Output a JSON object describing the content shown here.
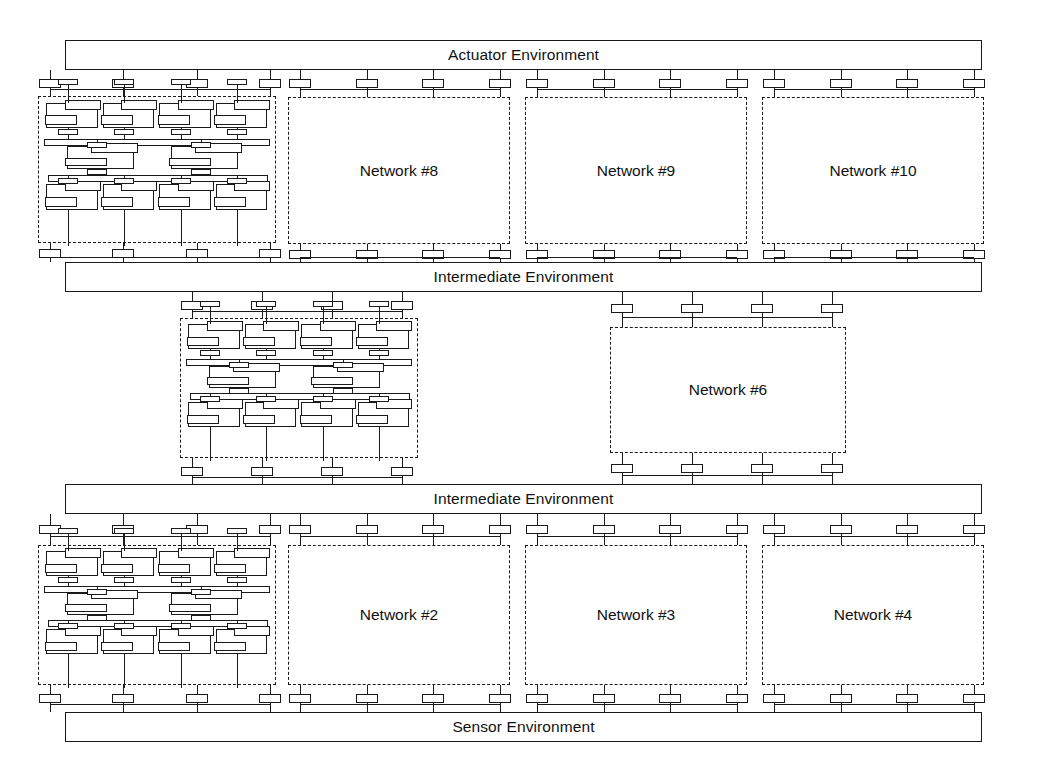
{
  "diagram": {
    "stroke_color": "#1a1a1a",
    "background_color": "#ffffff",
    "width": 1038,
    "height": 778
  },
  "environments": [
    {
      "id": "actuator",
      "label": "Actuator Environment",
      "x": 65,
      "y": 40,
      "w": 917,
      "h": 30
    },
    {
      "id": "intermediate1",
      "label": "Intermediate Environment",
      "x": 65,
      "y": 262,
      "w": 917,
      "h": 30
    },
    {
      "id": "intermediate2",
      "label": "Intermediate Environment",
      "x": 65,
      "y": 484,
      "w": 917,
      "h": 30
    },
    {
      "id": "sensor",
      "label": "Sensor Environment",
      "x": 65,
      "y": 712,
      "w": 917,
      "h": 30
    }
  ],
  "networks": [
    {
      "id": "net8",
      "label": "Network #8",
      "x": 288,
      "y": 97,
      "w": 222,
      "h": 147
    },
    {
      "id": "net9",
      "label": "Network #9",
      "x": 525,
      "y": 97,
      "w": 222,
      "h": 147
    },
    {
      "id": "net10",
      "label": "Network #10",
      "x": 762,
      "y": 97,
      "w": 222,
      "h": 147
    },
    {
      "id": "net6",
      "label": "Network #6",
      "x": 610,
      "y": 327,
      "w": 236,
      "h": 126
    },
    {
      "id": "net2",
      "label": "Network #2",
      "x": 288,
      "y": 545,
      "w": 222,
      "h": 140
    },
    {
      "id": "net3",
      "label": "Network #3",
      "x": 525,
      "y": 545,
      "w": 222,
      "h": 140
    },
    {
      "id": "net4",
      "label": "Network #4",
      "x": 762,
      "y": 545,
      "w": 222,
      "h": 140
    }
  ],
  "expanded_networks": [
    {
      "id": "expanded-top",
      "x": 38,
      "y": 96,
      "w": 238,
      "h": 147,
      "note": "expanded recursive network detail"
    },
    {
      "id": "expanded-middle",
      "x": 180,
      "y": 318,
      "w": 238,
      "h": 140,
      "note": "expanded recursive network detail"
    },
    {
      "id": "expanded-bottom",
      "x": 38,
      "y": 545,
      "w": 238,
      "h": 140,
      "note": "expanded recursive network detail"
    }
  ],
  "connector_groups": [
    {
      "id": "actuator-to-expanded-top",
      "x": 50,
      "w": 220,
      "top_y": 70,
      "bottom_y": 96,
      "count": 4,
      "direction": "down"
    },
    {
      "id": "actuator-to-net8",
      "x": 300,
      "w": 200,
      "top_y": 70,
      "bottom_y": 97,
      "count": 4,
      "direction": "down"
    },
    {
      "id": "actuator-to-net9",
      "x": 537,
      "w": 200,
      "top_y": 70,
      "bottom_y": 97,
      "count": 4,
      "direction": "down"
    },
    {
      "id": "actuator-to-net10",
      "x": 774,
      "w": 200,
      "top_y": 70,
      "bottom_y": 97,
      "count": 4,
      "direction": "down"
    },
    {
      "id": "expanded-top-to-inter1",
      "x": 50,
      "w": 220,
      "top_y": 243,
      "bottom_y": 262,
      "count": 4,
      "direction": "up"
    },
    {
      "id": "net8-to-inter1",
      "x": 300,
      "w": 200,
      "top_y": 244,
      "bottom_y": 262,
      "count": 4,
      "direction": "up"
    },
    {
      "id": "net9-to-inter1",
      "x": 537,
      "w": 200,
      "top_y": 244,
      "bottom_y": 262,
      "count": 4,
      "direction": "up"
    },
    {
      "id": "net10-to-inter1",
      "x": 774,
      "w": 200,
      "top_y": 244,
      "bottom_y": 262,
      "count": 4,
      "direction": "up"
    },
    {
      "id": "inter1-to-expanded-mid",
      "x": 192,
      "w": 210,
      "top_y": 292,
      "bottom_y": 318,
      "count": 4,
      "direction": "down"
    },
    {
      "id": "inter1-to-net6",
      "x": 622,
      "w": 210,
      "top_y": 292,
      "bottom_y": 327,
      "count": 4,
      "direction": "down"
    },
    {
      "id": "expanded-mid-to-inter2",
      "x": 192,
      "w": 210,
      "top_y": 458,
      "bottom_y": 484,
      "count": 4,
      "direction": "up"
    },
    {
      "id": "net6-to-inter2",
      "x": 622,
      "w": 210,
      "top_y": 453,
      "bottom_y": 484,
      "count": 4,
      "direction": "up"
    },
    {
      "id": "inter2-to-expanded-bot",
      "x": 50,
      "w": 220,
      "top_y": 514,
      "bottom_y": 545,
      "count": 4,
      "direction": "down"
    },
    {
      "id": "inter2-to-net2",
      "x": 300,
      "w": 200,
      "top_y": 514,
      "bottom_y": 545,
      "count": 4,
      "direction": "down"
    },
    {
      "id": "inter2-to-net3",
      "x": 537,
      "w": 200,
      "top_y": 514,
      "bottom_y": 545,
      "count": 4,
      "direction": "down"
    },
    {
      "id": "inter2-to-net4",
      "x": 774,
      "w": 200,
      "top_y": 514,
      "bottom_y": 545,
      "count": 4,
      "direction": "down"
    },
    {
      "id": "expanded-bot-to-sensor",
      "x": 50,
      "w": 220,
      "top_y": 685,
      "bottom_y": 712,
      "count": 4,
      "direction": "up"
    },
    {
      "id": "net2-to-sensor",
      "x": 300,
      "w": 200,
      "top_y": 685,
      "bottom_y": 712,
      "count": 4,
      "direction": "up"
    },
    {
      "id": "net3-to-sensor",
      "x": 537,
      "w": 200,
      "top_y": 685,
      "bottom_y": 712,
      "count": 4,
      "direction": "up"
    },
    {
      "id": "net4-to-sensor",
      "x": 774,
      "w": 200,
      "top_y": 685,
      "bottom_y": 712,
      "count": 4,
      "direction": "up"
    }
  ],
  "fractal_structure": {
    "description": "Each expanded network repeats the whole diagram at smaller scale",
    "row_units": [
      4,
      2,
      4
    ],
    "bus_levels": 4
  }
}
